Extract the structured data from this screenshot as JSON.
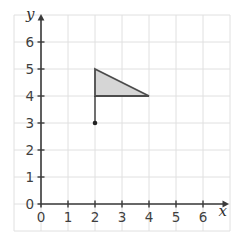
{
  "chart_data": {
    "type": "scatter",
    "title": "",
    "xlabel": "x",
    "ylabel": "y",
    "xlim": [
      -1,
      7
    ],
    "ylim": [
      -1,
      7
    ],
    "grid": true,
    "legend": false,
    "x_tick_labels": [
      "0",
      "1",
      "2",
      "3",
      "4",
      "5",
      "6"
    ],
    "y_tick_labels": [
      "0",
      "1",
      "2",
      "3",
      "4",
      "5",
      "6"
    ],
    "x_tick_values": [
      0,
      1,
      2,
      3,
      4,
      5,
      6
    ],
    "y_tick_values": [
      0,
      1,
      2,
      3,
      4,
      5,
      6
    ],
    "shapes": [
      {
        "id": "triangle",
        "kind": "polygon",
        "vertices": [
          [
            2,
            5
          ],
          [
            4,
            4
          ],
          [
            2,
            4
          ]
        ],
        "fill": "#d6d6d6",
        "stroke": "#4c4c4c",
        "stroke_width": 1.8
      },
      {
        "id": "stem-segment",
        "kind": "segment",
        "from": [
          2,
          4
        ],
        "to": [
          2,
          3
        ],
        "stroke": "#3a3a3a",
        "stroke_width": 1.4
      },
      {
        "id": "marked-point",
        "kind": "point",
        "at": [
          2,
          3
        ],
        "color": "#222222",
        "radius": 2.3
      }
    ],
    "colors": {
      "background": "#ffffff",
      "grid_line": "#e0e0e0",
      "axis": "#3a3a3a",
      "tick": "#3a3a3a",
      "tick_label": "#3f3f3f",
      "axis_letter": "#2f2f2f"
    }
  }
}
